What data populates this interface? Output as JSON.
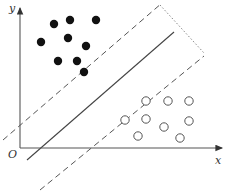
{
  "diagram": {
    "title": "",
    "axes": {
      "x_label": "x",
      "y_label": "y",
      "origin_label": "O"
    },
    "colors": {
      "axis": "#555555",
      "filled": "#111111",
      "hollow": "#555555",
      "line": "#444444",
      "dashed": "#555555",
      "dotted": "#888888"
    },
    "filled_points": [
      [
        54,
        24
      ],
      [
        70,
        20
      ],
      [
        96,
        20
      ],
      [
        41,
        42
      ],
      [
        68,
        38
      ],
      [
        86,
        46
      ],
      [
        58,
        61
      ],
      [
        77,
        61
      ],
      [
        84,
        72
      ]
    ],
    "hollow_points": [
      [
        146,
        101
      ],
      [
        168,
        101
      ],
      [
        189,
        101
      ],
      [
        125,
        120
      ],
      [
        146,
        119
      ],
      [
        164,
        127
      ],
      [
        189,
        121
      ],
      [
        138,
        136
      ],
      [
        180,
        138
      ]
    ],
    "separator": {
      "x1": 27,
      "y1": 160,
      "x2": 174,
      "y2": 32
    },
    "margin_upper": {
      "x1": 3,
      "y1": 140,
      "x2": 162,
      "y2": 3
    },
    "margin_lower": {
      "x1": 40,
      "y1": 190,
      "x2": 204,
      "y2": 56
    },
    "margin_width_marker": {
      "x1": 160,
      "y1": 5,
      "x2": 204,
      "y2": 53
    }
  }
}
